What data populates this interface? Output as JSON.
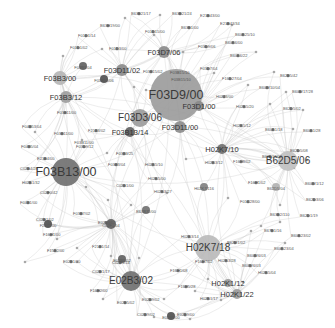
{
  "diagram": {
    "type": "network-graph",
    "background": "#ffffff",
    "edge_color": "#c9c9c9",
    "nodes": [
      {
        "id": "F03D9/00",
        "x": 176,
        "y": 95,
        "r": 26,
        "color": "#9a9a9a",
        "size": "xl"
      },
      {
        "id": "F03B13/00",
        "x": 66,
        "y": 172,
        "r": 14,
        "color": "#6e6e6e",
        "size": "xl"
      },
      {
        "id": "H02K7/18",
        "x": 110,
        "y": 246,
        "r": 0,
        "color": "#b0b0b0",
        "size": "none"
      },
      {
        "id": "H02K7/18",
        "x": 208,
        "y": 248,
        "r": 13,
        "color": "#b9b9b9",
        "size": "l"
      },
      {
        "id": "E02B3/02",
        "x": 131,
        "y": 281,
        "r": 10,
        "color": "#6e6e6e",
        "size": "l"
      },
      {
        "id": "F03D3/06",
        "x": 140,
        "y": 118,
        "r": 9,
        "color": "#9a9a9a",
        "size": "l"
      },
      {
        "id": "B62D5/06",
        "x": 288,
        "y": 161,
        "r": 10,
        "color": "#c0c0c0",
        "size": "l"
      },
      {
        "id": "F03B3/00",
        "x": 60,
        "y": 78,
        "r": 7,
        "color": "#b5b5b5",
        "size": "m"
      },
      {
        "id": "F03B3/12",
        "x": 66,
        "y": 97,
        "r": 6,
        "color": "#9c9c9c",
        "size": "m"
      },
      {
        "id": "F03D11/02",
        "x": 122,
        "y": 70,
        "r": 6,
        "color": "#8a8a8a",
        "size": "m"
      },
      {
        "id": "F03D7/06",
        "x": 164,
        "y": 52,
        "r": 6,
        "color": "#8a8a8a",
        "size": "m"
      },
      {
        "id": "F03D11/00",
        "x": 180,
        "y": 127,
        "r": 6,
        "color": "#8a8a8a",
        "size": "m"
      },
      {
        "id": "F03D1/00",
        "x": 199,
        "y": 106,
        "r": 5,
        "color": "#8a8a8a",
        "size": "m"
      },
      {
        "id": "F03B13/14",
        "x": 130,
        "y": 132,
        "r": 5,
        "color": "#5e5e5e",
        "size": "m"
      },
      {
        "id": "H02K7/10",
        "x": 222,
        "y": 149,
        "r": 5,
        "color": "#6e6e6e",
        "size": "m"
      },
      {
        "id": "H02K1/12",
        "x": 228,
        "y": 283,
        "r": 4,
        "color": "#9a9a9a",
        "size": "m"
      },
      {
        "id": "H02K1/22",
        "x": 237,
        "y": 294,
        "r": 5,
        "color": "#9a9a9a",
        "size": "m"
      },
      {
        "id": "F03B15/10",
        "x": 181,
        "y": 78,
        "r": 0,
        "color": "#8a8a8a",
        "size": "s"
      },
      {
        "id": "B62D5/04",
        "x": 276,
        "y": 187,
        "r": 4,
        "color": "#b0b0b0",
        "size": "s"
      },
      {
        "id": "C02F1/04",
        "x": 111,
        "y": 224,
        "r": 5,
        "color": "#5e5e5e",
        "size": "s"
      },
      {
        "id": "E02B9/02",
        "x": 122,
        "y": 259,
        "r": 4,
        "color": "#5e5e5e",
        "size": "s"
      },
      {
        "id": "E02B9/00",
        "x": 171,
        "y": 316,
        "r": 4,
        "color": "#4e4e4e",
        "size": "s"
      },
      {
        "id": "F24J2/00",
        "x": 48,
        "y": 224,
        "r": 4,
        "color": "#4e4e4e",
        "size": "s"
      },
      {
        "id": "B63B35/00",
        "x": 146,
        "y": 210,
        "r": 4,
        "color": "#6e6e6e",
        "size": "s"
      },
      {
        "id": "H02K7/116",
        "x": 204,
        "y": 187,
        "r": 4,
        "color": "#7e7e7e",
        "size": "s"
      },
      {
        "id": "F03B13/06",
        "x": 104,
        "y": 79,
        "r": 4,
        "color": "#4e4e4e",
        "size": "s"
      },
      {
        "id": "F03B11/00",
        "x": 84,
        "y": 141,
        "r": 0,
        "color": "#8a8a8a",
        "size": "s"
      },
      {
        "id": "F03B3/04",
        "x": 83,
        "y": 66,
        "r": 4,
        "color": "#5e5e5e",
        "size": "s"
      }
    ],
    "small_labels": [
      {
        "text": "B63B21/17",
        "x": 131,
        "y": 15
      },
      {
        "text": "B63B21/24",
        "x": 172,
        "y": 15
      },
      {
        "text": "E21B43/00",
        "x": 200,
        "y": 17
      },
      {
        "text": "B63H19/00",
        "x": 100,
        "y": 27
      },
      {
        "text": "B63B1/00",
        "x": 181,
        "y": 29
      },
      {
        "text": "E21B43/34",
        "x": 220,
        "y": 25
      },
      {
        "text": "F01D1/14",
        "x": 78,
        "y": 37
      },
      {
        "text": "F01D15/00",
        "x": 145,
        "y": 33
      },
      {
        "text": "B60K25/10",
        "x": 235,
        "y": 36
      },
      {
        "text": "F01D1/02",
        "x": 70,
        "y": 49
      },
      {
        "text": "F01D3/00",
        "x": 109,
        "y": 50
      },
      {
        "text": "B60K6/00",
        "x": 225,
        "y": 44
      },
      {
        "text": "F03D9/06",
        "x": 198,
        "y": 48
      },
      {
        "text": "B60K6/22",
        "x": 230,
        "y": 57
      },
      {
        "text": "F03B15/10",
        "x": 170,
        "y": 74
      },
      {
        "text": "F03D7/04",
        "x": 200,
        "y": 70
      },
      {
        "text": "F03B15/02",
        "x": 143,
        "y": 73
      },
      {
        "text": "F16D27/04",
        "x": 222,
        "y": 80
      },
      {
        "text": "B62B5/42",
        "x": 280,
        "y": 77
      },
      {
        "text": "B60W10/04",
        "x": 259,
        "y": 89
      },
      {
        "text": "B60W17/28",
        "x": 292,
        "y": 93
      },
      {
        "text": "H02J3/00",
        "x": 216,
        "y": 98
      },
      {
        "text": "H02K5/20",
        "x": 236,
        "y": 108
      },
      {
        "text": "B62D5/02",
        "x": 283,
        "y": 110
      },
      {
        "text": "F03B11/00",
        "x": 57,
        "y": 114
      },
      {
        "text": "F04B53/04",
        "x": 22,
        "y": 128
      },
      {
        "text": "F03B11/00",
        "x": 54,
        "y": 135
      },
      {
        "text": "F21B3/02",
        "x": 88,
        "y": 132
      },
      {
        "text": "F04B5/04",
        "x": 21,
        "y": 148
      },
      {
        "text": "F03D9/12",
        "x": 76,
        "y": 148
      },
      {
        "text": "H02K5/12",
        "x": 233,
        "y": 127
      },
      {
        "text": "B60K1/18",
        "x": 265,
        "y": 131
      },
      {
        "text": "B60K1/28",
        "x": 303,
        "y": 132
      },
      {
        "text": "E21B4/00",
        "x": 37,
        "y": 160
      },
      {
        "text": "C02B4/28",
        "x": 20,
        "y": 170
      },
      {
        "text": "F03B3/25",
        "x": 116,
        "y": 155
      },
      {
        "text": "F03B3/04",
        "x": 108,
        "y": 166
      },
      {
        "text": "H02K5/10",
        "x": 145,
        "y": 166
      },
      {
        "text": "H02K3/12",
        "x": 205,
        "y": 164
      },
      {
        "text": "F16H8/02",
        "x": 233,
        "y": 163
      },
      {
        "text": "B62D13/02",
        "x": 262,
        "y": 158
      },
      {
        "text": "B62D5/08",
        "x": 290,
        "y": 152
      },
      {
        "text": "H02K1/32",
        "x": 22,
        "y": 184
      },
      {
        "text": "C02F0/42",
        "x": 40,
        "y": 194
      },
      {
        "text": "F04B1/00",
        "x": 20,
        "y": 204
      },
      {
        "text": "C02B1/00",
        "x": 116,
        "y": 187
      },
      {
        "text": "H02K5/00",
        "x": 148,
        "y": 180
      },
      {
        "text": "H02K3/27",
        "x": 154,
        "y": 193
      },
      {
        "text": "F16H1/02",
        "x": 248,
        "y": 184
      },
      {
        "text": "B60W1/12",
        "x": 305,
        "y": 185
      },
      {
        "text": "F01C28/00",
        "x": 240,
        "y": 203
      },
      {
        "text": "B62D3/06",
        "x": 306,
        "y": 201
      },
      {
        "text": "C02B1/02",
        "x": 36,
        "y": 221
      },
      {
        "text": "F03B7/02",
        "x": 73,
        "y": 215
      },
      {
        "text": "E02B8/02",
        "x": 98,
        "y": 224
      },
      {
        "text": "F16H1/00",
        "x": 43,
        "y": 236
      },
      {
        "text": "B63B2/110",
        "x": 270,
        "y": 216
      },
      {
        "text": "B62D1/19",
        "x": 300,
        "y": 217
      },
      {
        "text": "F15B2/00",
        "x": 47,
        "y": 252
      },
      {
        "text": "F21B1/14",
        "x": 92,
        "y": 248
      },
      {
        "text": "B67B1/16",
        "x": 264,
        "y": 232
      },
      {
        "text": "H02K3/14",
        "x": 181,
        "y": 238
      },
      {
        "text": "B60K23/02",
        "x": 291,
        "y": 237
      },
      {
        "text": "E02B1/30",
        "x": 63,
        "y": 263
      },
      {
        "text": "C02B1/14",
        "x": 112,
        "y": 264
      },
      {
        "text": "B62M1/02",
        "x": 227,
        "y": 244
      },
      {
        "text": "B60K23/04",
        "x": 274,
        "y": 250
      },
      {
        "text": "C02B1/17",
        "x": 92,
        "y": 273
      },
      {
        "text": "B60W6/03",
        "x": 247,
        "y": 257
      },
      {
        "text": "F16H7/02",
        "x": 195,
        "y": 263
      },
      {
        "text": "H02K3/28",
        "x": 218,
        "y": 262
      },
      {
        "text": "B60W6/03",
        "x": 242,
        "y": 267
      },
      {
        "text": "F16H1/08",
        "x": 170,
        "y": 272
      },
      {
        "text": "H02K5/04",
        "x": 258,
        "y": 274
      },
      {
        "text": "F16H2/00",
        "x": 90,
        "y": 292
      },
      {
        "text": "F16H5/28",
        "x": 178,
        "y": 288
      },
      {
        "text": "E02B5/02",
        "x": 117,
        "y": 304
      },
      {
        "text": "E02B9/02",
        "x": 142,
        "y": 301
      },
      {
        "text": "H02K1/17",
        "x": 200,
        "y": 300
      },
      {
        "text": "C02B9/02",
        "x": 137,
        "y": 316
      },
      {
        "text": "E02B9/00",
        "x": 177,
        "y": 316
      }
    ],
    "dots": [
      {
        "x": 125,
        "y": 18
      },
      {
        "x": 160,
        "y": 15
      },
      {
        "x": 232,
        "y": 25
      },
      {
        "x": 154,
        "y": 35
      },
      {
        "x": 102,
        "y": 49
      },
      {
        "x": 63,
        "y": 56
      },
      {
        "x": 256,
        "y": 52
      },
      {
        "x": 183,
        "y": 52
      },
      {
        "x": 146,
        "y": 90
      },
      {
        "x": 134,
        "y": 87
      },
      {
        "x": 214,
        "y": 73
      },
      {
        "x": 274,
        "y": 72
      },
      {
        "x": 248,
        "y": 85
      },
      {
        "x": 286,
        "y": 92
      },
      {
        "x": 270,
        "y": 104
      },
      {
        "x": 303,
        "y": 110
      },
      {
        "x": 293,
        "y": 129
      },
      {
        "x": 35,
        "y": 132
      },
      {
        "x": 107,
        "y": 153
      },
      {
        "x": 186,
        "y": 159
      },
      {
        "x": 294,
        "y": 168
      },
      {
        "x": 307,
        "y": 160
      },
      {
        "x": 86,
        "y": 187
      },
      {
        "x": 108,
        "y": 200
      },
      {
        "x": 167,
        "y": 193
      },
      {
        "x": 228,
        "y": 198
      },
      {
        "x": 280,
        "y": 205
      },
      {
        "x": 251,
        "y": 231
      },
      {
        "x": 57,
        "y": 239
      },
      {
        "x": 77,
        "y": 248
      },
      {
        "x": 77,
        "y": 262
      },
      {
        "x": 111,
        "y": 256
      },
      {
        "x": 280,
        "y": 222
      },
      {
        "x": 261,
        "y": 226
      },
      {
        "x": 285,
        "y": 243
      },
      {
        "x": 208,
        "y": 279
      },
      {
        "x": 195,
        "y": 291
      },
      {
        "x": 243,
        "y": 282
      },
      {
        "x": 221,
        "y": 300
      },
      {
        "x": 164,
        "y": 299
      },
      {
        "x": 103,
        "y": 299
      },
      {
        "x": 154,
        "y": 317
      },
      {
        "x": 190,
        "y": 319
      },
      {
        "x": 82,
        "y": 140
      },
      {
        "x": 131,
        "y": 205
      },
      {
        "x": 139,
        "y": 258
      },
      {
        "x": 25,
        "y": 262
      }
    ]
  }
}
